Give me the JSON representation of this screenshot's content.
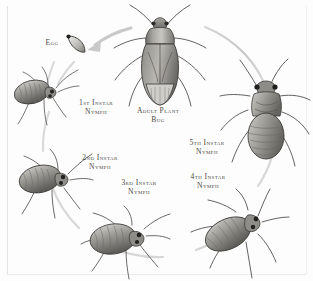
{
  "figure": {
    "kind": "life-cycle-diagram",
    "subject": "Plant Bug",
    "palette": {
      "ring": "#cfcfcf",
      "arrow": "#c4c4c4",
      "label_text": "#4a4a46",
      "body_dark": "#54524f",
      "body_mid": "#8e8c88",
      "body_light": "#d9d7d3",
      "outline": "#3a3836",
      "background": "#fdfdfd"
    }
  },
  "stages": [
    {
      "id": "egg",
      "label_line1": "Egg",
      "label_line2": "",
      "order": 1,
      "x": 52,
      "y": 44
    },
    {
      "id": "first-instar-nymph",
      "label_line1": "1st Instar",
      "label_line2": "Nymph",
      "order": 2,
      "x": 96,
      "y": 107
    },
    {
      "id": "second-instar-nymph",
      "label_line1": "2nd Instar",
      "label_line2": "Nymph",
      "order": 3,
      "x": 100,
      "y": 162
    },
    {
      "id": "third-instar-nymph",
      "label_line1": "3rd Instar",
      "label_line2": "Nymph",
      "order": 4,
      "x": 139,
      "y": 187
    },
    {
      "id": "fourth-instar-nymph",
      "label_line1": "4th Instar",
      "label_line2": "Nymph",
      "order": 5,
      "x": 208,
      "y": 181
    },
    {
      "id": "fifth-instar-nymph",
      "label_line1": "5th Instar",
      "label_line2": "Nymph",
      "order": 6,
      "x": 207,
      "y": 147
    },
    {
      "id": "adult-plant-bug",
      "label_line1": "Adult Plant",
      "label_line2": "Bug",
      "order": 7,
      "x": 158,
      "y": 115
    }
  ],
  "icons": {
    "egg": "egg-icon",
    "cycle_arrow": "cycle-arrow-icon",
    "adult": "adult-plant-bug-icon",
    "nymph1": "first-instar-nymph-icon",
    "nymph2": "second-instar-nymph-icon",
    "nymph3": "third-instar-nymph-icon",
    "nymph4": "fourth-instar-nymph-icon",
    "nymph5": "fifth-instar-nymph-icon"
  }
}
